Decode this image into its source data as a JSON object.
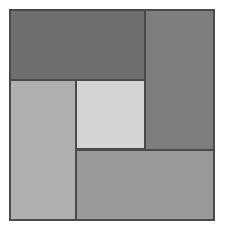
{
  "figure": {
    "background_color": "#ffffff",
    "canvas_width": 226,
    "canvas_height": 232,
    "stroke_color": "#4a4a4a",
    "stroke_width": 1.4
  },
  "chart_data": {
    "type": "table",
    "subtitle": "",
    "xlabel": "",
    "ylabel": "",
    "grid": false,
    "legend_position": "none",
    "xlim": [
      10,
      214
    ],
    "ylim": [
      10,
      220
    ],
    "categories": [
      "top-left-rectangle",
      "right-rectangle",
      "left-rectangle",
      "center-square",
      "bottom-rectangle"
    ],
    "values": [
      9450,
      9660,
      9240,
      4761,
      9660
    ],
    "regions": [
      {
        "name": "top-left-rectangle",
        "label": "Top left rectangle",
        "x": 10,
        "y": 10,
        "width": 135,
        "height": 70,
        "color": "#6f6f6f",
        "area": 9450
      },
      {
        "name": "right-rectangle",
        "label": "Right rectangle",
        "x": 145,
        "y": 10,
        "width": 69,
        "height": 140,
        "color": "#7e7e7e",
        "area": 9660
      },
      {
        "name": "left-rectangle",
        "label": "Left rectangle",
        "x": 10,
        "y": 80,
        "width": 66,
        "height": 140,
        "color": "#b0b0b0",
        "area": 9240
      },
      {
        "name": "center-square",
        "label": "Center square",
        "x": 76,
        "y": 80,
        "width": 69,
        "height": 69,
        "color": "#d4d4d4",
        "area": 4761
      },
      {
        "name": "bottom-rectangle",
        "label": "Bottom rectangle",
        "x": 76,
        "y": 150,
        "width": 138,
        "height": 70,
        "color": "#9a9a9a",
        "area": 9660
      }
    ],
    "outer_square": {
      "x": 10,
      "y": 10,
      "width": 204,
      "height": 210
    }
  }
}
